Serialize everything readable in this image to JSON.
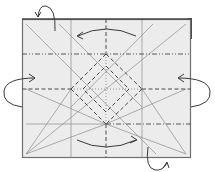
{
  "diagram": {
    "colors": {
      "paper": "#ececec",
      "paper_edge": "#6f6f6f",
      "back_layer": "#4a4a4a",
      "crease_thin": "#8c8c8c",
      "crease_fold": "#4a4a4a",
      "arrow": "#3a3a3a"
    },
    "paper": {
      "x": 22,
      "y": 19,
      "w": 169,
      "h": 139
    },
    "grid": {
      "verticals": [
        71,
        106,
        142
      ],
      "horizontals": [
        54,
        89,
        124
      ]
    },
    "legend": {
      "valley_fold": "dashed line",
      "mountain_fold": "dash-dot line",
      "crease": "thin solid line"
    },
    "arrows": [
      {
        "name": "top-fold-left",
        "direction": "left"
      },
      {
        "name": "bottom-fold-right",
        "direction": "right"
      },
      {
        "name": "left-flip-in",
        "direction": "right"
      },
      {
        "name": "right-flip-in",
        "direction": "left"
      },
      {
        "name": "top-left-turn-over",
        "direction": "behind"
      },
      {
        "name": "bottom-right-turn-over",
        "direction": "behind"
      }
    ]
  }
}
